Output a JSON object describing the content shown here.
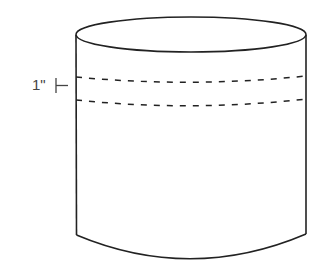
{
  "diagram": {
    "type": "cylinder-with-band",
    "measurement_label": "1\"",
    "colors": {
      "stroke": "#222222",
      "label": "#444444",
      "background": "#ffffff"
    }
  }
}
